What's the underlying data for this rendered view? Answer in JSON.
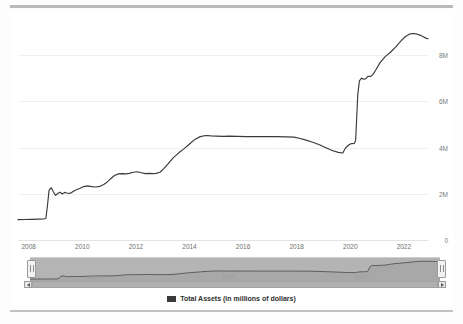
{
  "chart_data": {
    "type": "line",
    "title": "",
    "xlabel": "",
    "ylabel": "",
    "ylim": [
      0,
      9600000
    ],
    "yticks": [
      0,
      2000000,
      4000000,
      6000000,
      8000000
    ],
    "ytick_labels": [
      "0",
      "2M",
      "4M",
      "6M",
      "8M"
    ],
    "xlim": [
      2007.6,
      2022.9
    ],
    "xticks": [
      2008,
      2010,
      2012,
      2014,
      2016,
      2018,
      2020,
      2022
    ],
    "xtick_labels": [
      "2008",
      "2010",
      "2012",
      "2014",
      "2016",
      "2018",
      "2020",
      "2022"
    ],
    "grid": true,
    "legend_position": "bottom-center",
    "series": [
      {
        "name": "Total Assets (in millions of dollars)",
        "color": "#3a3a3a",
        "x": [
          2007.6,
          2007.85,
          2008.1,
          2008.35,
          2008.55,
          2008.64,
          2008.7,
          2008.76,
          2008.84,
          2008.92,
          2009.0,
          2009.08,
          2009.17,
          2009.25,
          2009.34,
          2009.42,
          2009.5,
          2009.6,
          2009.7,
          2009.8,
          2009.92,
          2010.05,
          2010.2,
          2010.35,
          2010.5,
          2010.66,
          2010.8,
          2010.92,
          2011.05,
          2011.2,
          2011.35,
          2011.5,
          2011.62,
          2011.75,
          2011.9,
          2012.05,
          2012.2,
          2012.35,
          2012.5,
          2012.62,
          2012.75,
          2012.9,
          2013.05,
          2013.2,
          2013.4,
          2013.6,
          2013.8,
          2014.0,
          2014.2,
          2014.4,
          2014.6,
          2014.8,
          2015.0,
          2015.25,
          2015.5,
          2015.8,
          2016.1,
          2016.5,
          2016.9,
          2017.25,
          2017.6,
          2017.9,
          2018.1,
          2018.35,
          2018.6,
          2018.85,
          2019.05,
          2019.3,
          2019.55,
          2019.72,
          2019.82,
          2019.95,
          2020.05,
          2020.15,
          2020.2,
          2020.24,
          2020.28,
          2020.34,
          2020.42,
          2020.5,
          2020.58,
          2020.66,
          2020.75,
          2020.85,
          2020.95,
          2021.1,
          2021.3,
          2021.5,
          2021.7,
          2021.9,
          2022.05,
          2022.2,
          2022.35,
          2022.5,
          2022.62,
          2022.72,
          2022.82,
          2022.9
        ],
        "y": [
          880000,
          885000,
          890000,
          900000,
          910000,
          930000,
          1500000,
          2160000,
          2260000,
          2090000,
          1930000,
          2010000,
          2070000,
          1990000,
          2060000,
          2030000,
          2010000,
          2050000,
          2130000,
          2180000,
          2240000,
          2310000,
          2340000,
          2310000,
          2290000,
          2320000,
          2400000,
          2500000,
          2640000,
          2790000,
          2860000,
          2870000,
          2860000,
          2880000,
          2930000,
          2950000,
          2910000,
          2870000,
          2880000,
          2870000,
          2880000,
          2930000,
          3100000,
          3290000,
          3560000,
          3770000,
          3950000,
          4150000,
          4350000,
          4470000,
          4520000,
          4500000,
          4490000,
          4480000,
          4490000,
          4480000,
          4470000,
          4470000,
          4470000,
          4470000,
          4460000,
          4450000,
          4400000,
          4320000,
          4230000,
          4120000,
          4010000,
          3880000,
          3790000,
          3760000,
          3980000,
          4120000,
          4170000,
          4180000,
          4300000,
          5300000,
          6300000,
          6880000,
          7000000,
          6950000,
          6980000,
          7080000,
          7070000,
          7160000,
          7350000,
          7650000,
          7930000,
          8120000,
          8350000,
          8620000,
          8790000,
          8900000,
          8930000,
          8900000,
          8850000,
          8790000,
          8730000,
          8700000
        ]
      }
    ]
  },
  "legend": {
    "label": "Total Assets (in millions of dollars)",
    "swatch_color": "#3a3a3a"
  },
  "navigator": {
    "labels": [
      "2010",
      "2015",
      "2020"
    ],
    "label_x": [
      2010,
      2015,
      2020
    ],
    "left_handle": "navigator-left-handle",
    "right_handle": "navigator-right-handle",
    "scroll_left_arrow": "◀",
    "scroll_right_arrow": "▶"
  }
}
